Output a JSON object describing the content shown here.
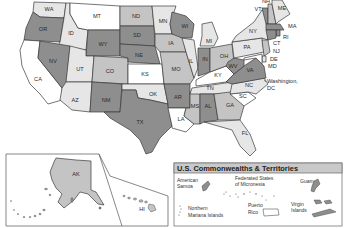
{
  "map": {
    "title": "United States map",
    "colors": {
      "white": "#ffffff",
      "light": "#e6e6e6",
      "medium": "#c4c4c4",
      "dark": "#8e8e8e",
      "stroke": "#3a3a3a"
    },
    "states": {
      "WA": "WA",
      "OR": "OR",
      "CA": "CA",
      "ID": "ID",
      "NV": "NV",
      "MT": "MT",
      "WY": "WY",
      "UT": "UT",
      "AZ": "AZ",
      "CO": "CO",
      "NM": "NM",
      "ND": "ND",
      "SD": "SD",
      "NE": "NE",
      "KS": "KS",
      "OK": "OK",
      "TX": "TX",
      "MN": "MN",
      "IA": "IA",
      "MO": "MO",
      "AR": "AR",
      "LA": "LA",
      "WI": "WI",
      "IL": "IL",
      "MS": "MS",
      "MI": "MI",
      "IN": "IN",
      "KY": "KY",
      "TN": "TN",
      "AL": "AL",
      "OH": "OH",
      "GA": "GA",
      "FL": "FL",
      "SC": "SC",
      "NC": "NC",
      "VA": "VA",
      "WV": "WV",
      "PA": "PA",
      "NY": "NY",
      "VT": "VT",
      "NH": "NH",
      "ME": "ME",
      "MA": "MA",
      "RI": "RI",
      "CT": "CT",
      "NJ": "NJ",
      "DE": "DE",
      "MD": "MD",
      "AK": "AK",
      "HI": "HI"
    },
    "dc_label_line1": "Washington,",
    "dc_label_line2": "DC"
  },
  "territories": {
    "title": "U.S. Commonwealths & Territories",
    "american_samoa_1": "American",
    "american_samoa_2": "Samoa",
    "micronesia_1": "Federated States",
    "micronesia_2": "of Micronesia",
    "guam": "Guam",
    "northern_mariana_1": "Northern",
    "northern_mariana_2": "Mariana Islands",
    "puerto_rico_1": "Puerto",
    "puerto_rico_2": "Rico",
    "virgin_islands_1": "Virgin",
    "virgin_islands_2": "Islands"
  }
}
